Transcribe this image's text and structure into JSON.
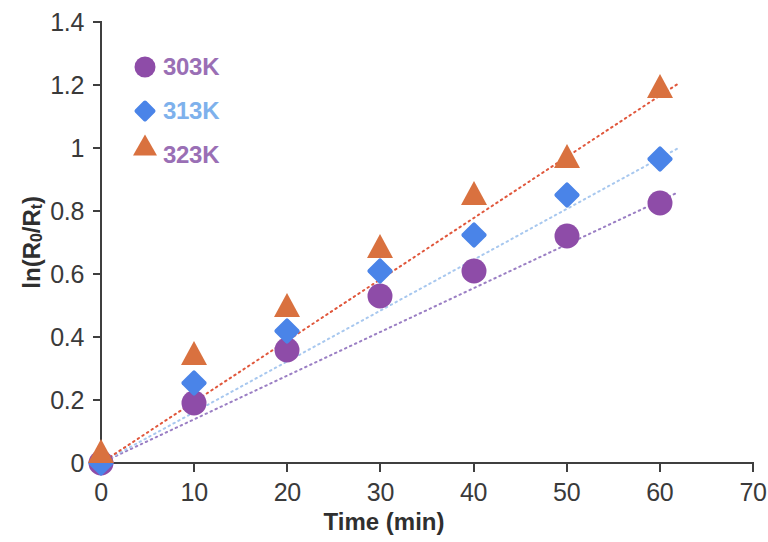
{
  "chart_data": {
    "type": "scatter",
    "title": "",
    "xlabel": "Time (min)",
    "ylabel": "ln(R0/Rt)",
    "ylabel_parts": {
      "prefix": "ln(R",
      "sub1": "0",
      "mid": "/R",
      "sub2": "t",
      "suffix": ")"
    },
    "x": [
      0,
      10,
      20,
      30,
      40,
      50,
      60
    ],
    "xlim": [
      0,
      70
    ],
    "ylim": [
      0,
      1.4
    ],
    "xticks": [
      0,
      10,
      20,
      30,
      40,
      50,
      60,
      70
    ],
    "xtick_labels": [
      "0",
      "10",
      "20",
      "30",
      "40",
      "50",
      "60",
      "70"
    ],
    "yticks": [
      0,
      0.2,
      0.4,
      0.6,
      0.8,
      1,
      1.2,
      1.4
    ],
    "ytick_labels": [
      "0",
      "0.2",
      "0.4",
      "0.6",
      "0.8",
      "1",
      "1.2",
      "1.4"
    ],
    "grid": false,
    "legend_position": "upper-left-inside",
    "series": [
      {
        "name": "303K",
        "marker": "circle",
        "color": "#8e4ca8",
        "label_color": "#9a6fb5",
        "trend_color": "#9b7fc4",
        "values": [
          0,
          0.19,
          0.36,
          0.53,
          0.61,
          0.72,
          0.825
        ],
        "trend_endpoint": [
          62,
          0.86
        ]
      },
      {
        "name": "313K",
        "marker": "diamond",
        "color": "#4a84e8",
        "label_color": "#7eb1ec",
        "trend_color": "#a8c8ef",
        "values": [
          0,
          0.255,
          0.42,
          0.61,
          0.725,
          0.85,
          0.965
        ],
        "trend_endpoint": [
          62,
          1.0
        ]
      },
      {
        "name": "323K",
        "marker": "triangle",
        "color": "#d9713f",
        "label_color": "#9a6fb5",
        "trend_color": "#e0573c",
        "values": [
          0,
          0.31,
          0.465,
          0.65,
          0.82,
          0.935,
          1.16
        ],
        "trend_endpoint": [
          62,
          1.205
        ]
      }
    ]
  },
  "axis": {
    "color": "#3f3f3f"
  }
}
